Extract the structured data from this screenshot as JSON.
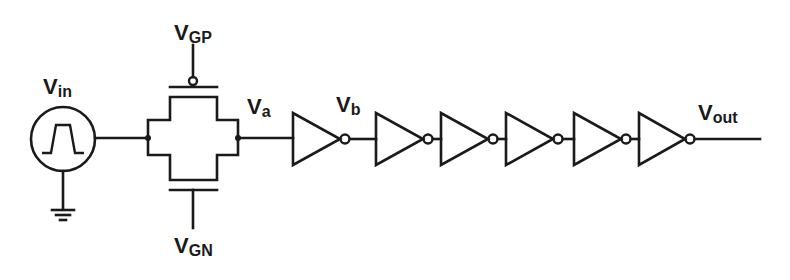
{
  "diagram": {
    "type": "circuit-schematic",
    "colors": {
      "line": "#1a1a1a",
      "background": "#ffffff"
    },
    "labels": {
      "vin": {
        "main": "V",
        "sub": "in"
      },
      "vgp": {
        "main": "V",
        "sub": "GP"
      },
      "vgn": {
        "main": "V",
        "sub": "GN"
      },
      "va": {
        "main": "V",
        "sub": "a"
      },
      "vb": {
        "main": "V",
        "sub": "b"
      },
      "vout": {
        "main": "V",
        "sub": "out"
      }
    },
    "components": {
      "source": {
        "kind": "pulse-voltage-source",
        "grounded": true
      },
      "transmission_gate": {
        "kind": "cmos-transmission-gate",
        "pmos_gate": "VGP",
        "nmos_gate": "VGN"
      },
      "inverter_count": 6
    },
    "inverters": [
      {
        "x": 293
      },
      {
        "x": 376
      },
      {
        "x": 441
      },
      {
        "x": 506
      },
      {
        "x": 574
      },
      {
        "x": 639
      }
    ]
  }
}
